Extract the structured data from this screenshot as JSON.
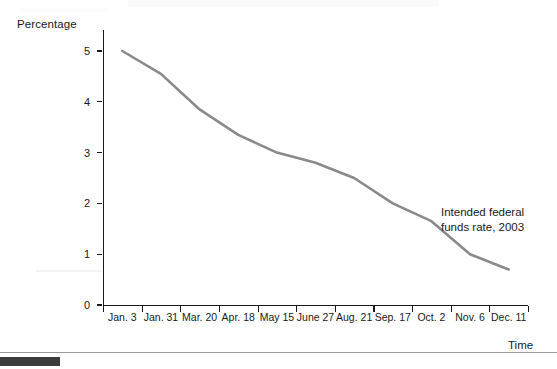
{
  "figure": {
    "name": "intended-federal-funds-rate-line-chart"
  },
  "labels": {
    "y_axis_title": "Percentage",
    "x_axis_title": "Time",
    "annotation_line_1": "Intended federal",
    "annotation_line_2": "funds rate, 2003"
  },
  "colors": {
    "series_line": "#8a8a8a",
    "axis": "#1a1a1a",
    "text": "#1a1a1a",
    "footer_bar": "#3b3b3b",
    "footer_rule": "#9a9a9a"
  },
  "chart_data": {
    "type": "line",
    "title": "",
    "subtitle": "",
    "xlabel": "Time",
    "ylabel": "Percentage",
    "ylim": [
      0,
      5.4
    ],
    "yticks": [
      0,
      1,
      2,
      3,
      4,
      5
    ],
    "ytick_labels": [
      "0",
      "1",
      "2",
      "3",
      "4",
      "5"
    ],
    "grid": false,
    "legend": "none",
    "annotations": [
      {
        "text": "Intended federal funds rate, 2003",
        "x": "Nov. 6",
        "y": 2.1
      }
    ],
    "categories": [
      "Jan. 3",
      "Jan. 31",
      "Mar. 20",
      "Apr. 18",
      "May 15",
      "June 27",
      "Aug. 21",
      "Sep. 17",
      "Oct. 2",
      "Nov. 6",
      "Dec. 11"
    ],
    "series": [
      {
        "name": "Intended federal funds rate, 2003",
        "color": "#8a8a8a",
        "values": [
          5.0,
          4.55,
          3.85,
          3.35,
          3.0,
          2.8,
          2.5,
          2.0,
          1.65,
          1.0,
          0.7
        ]
      }
    ]
  }
}
